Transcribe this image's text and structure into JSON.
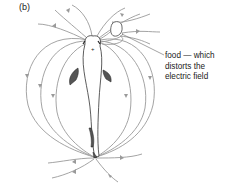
{
  "figure": {
    "panel_label": "(b)",
    "annotation": {
      "line1": "food — which",
      "line2": "distorts the",
      "line3": "electric field"
    },
    "elements": [
      "electric-fish",
      "field-lines",
      "food-object",
      "head-positive-pole",
      "tail-negative-pole"
    ],
    "colors": {
      "field_lines": "#9a9a9a",
      "outline": "#333333",
      "fins": "#555555"
    }
  }
}
